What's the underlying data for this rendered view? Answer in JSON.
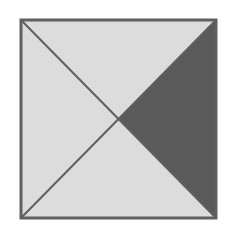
{
  "diagram": {
    "type": "square-with-diagonals",
    "square": {
      "x": 21,
      "y": 20,
      "width": 195,
      "height": 198
    },
    "colors": {
      "background": "#ffffff",
      "light_fill": "#dcdcdc",
      "dark_fill": "#5a5a5a",
      "stroke": "#5f5f5f"
    },
    "shaded_region": "right-triangle",
    "regions": [
      {
        "name": "top-triangle",
        "shaded": false
      },
      {
        "name": "right-triangle",
        "shaded": true
      },
      {
        "name": "bottom-triangle",
        "shaded": false
      },
      {
        "name": "left-triangle",
        "shaded": false
      }
    ]
  }
}
